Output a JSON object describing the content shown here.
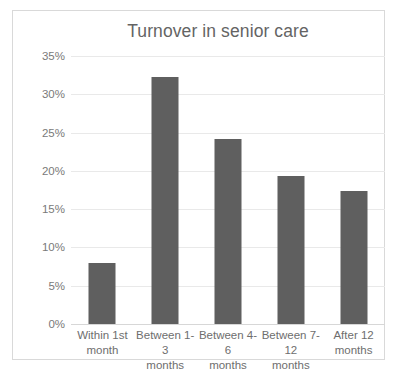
{
  "chart_data": {
    "type": "bar",
    "title": "Turnover in senior care",
    "xlabel": "",
    "ylabel": "",
    "categories": [
      "Within 1st month",
      "Between 1-3 months",
      "Between 4-6 months",
      "Between 7-12 months",
      "After 12 months"
    ],
    "category_lines": [
      [
        "Within 1st",
        "month"
      ],
      [
        "Between 1-3",
        "months"
      ],
      [
        "Between 4-6",
        "months"
      ],
      [
        "Between 7-12",
        "months"
      ],
      [
        "After 12",
        "months"
      ]
    ],
    "values": [
      8.0,
      32.2,
      24.2,
      19.3,
      17.4
    ],
    "ylim": [
      0,
      35
    ],
    "ytick_values": [
      0,
      5,
      10,
      15,
      20,
      25,
      30,
      35
    ],
    "ytick_labels": [
      "0%",
      "5%",
      "10%",
      "15%",
      "20%",
      "25%",
      "30%",
      "35%"
    ],
    "grid": true,
    "legend": false,
    "bar_color": "#5f5f5f",
    "gridline_color": "#e9e9e9",
    "title_color": "#646464",
    "border_color": "#d9d9d9",
    "background": "#ffffff"
  }
}
